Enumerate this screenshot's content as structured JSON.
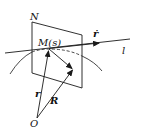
{
  "diagram": {
    "type": "geometry-vector-diagram",
    "labels": {
      "plane": "N",
      "point": "M(s)",
      "tangent": "ṙ",
      "line": "l",
      "position_vector": "r",
      "vector_R": "R",
      "origin": "O"
    },
    "colors": {
      "stroke": "#1a1a1a",
      "background": "#ffffff"
    },
    "elements": [
      {
        "kind": "plane",
        "label": "N",
        "shape": "parallelogram"
      },
      {
        "kind": "line",
        "label": "l",
        "passes_through": "M(s)",
        "direction_arrow": "ṙ"
      },
      {
        "kind": "curve",
        "passes_through": "M(s)",
        "dashed_segment_inside_plane": true
      },
      {
        "kind": "vector",
        "label": "r",
        "from": "O",
        "to": "M(s)"
      },
      {
        "kind": "vector",
        "label": "R",
        "from": "O",
        "to": "point in plane"
      },
      {
        "kind": "vector",
        "label": "",
        "from": "M(s)",
        "to": "point in plane"
      }
    ]
  }
}
